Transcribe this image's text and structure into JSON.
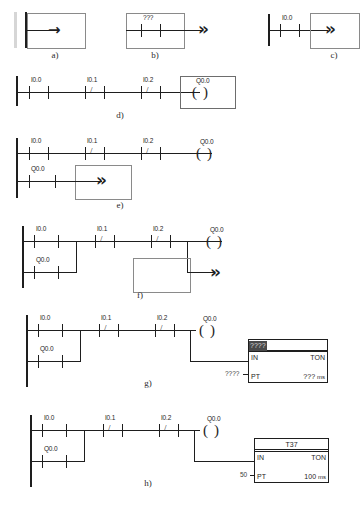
{
  "document": {
    "title": "Ladder logic editing sequence",
    "background_color": "#ffffff",
    "ink_color": "#1e1e1e"
  },
  "captions": {
    "a": "a)",
    "b": "b)",
    "c": "c)",
    "d": "d)",
    "e": "e)",
    "f": "f)",
    "g": "g)",
    "h": "h)"
  },
  "tags": {
    "unassigned": "???",
    "i00": "I0.0",
    "i01": "I0.1",
    "i02": "I0.2",
    "q00": "Q0.0",
    "nc_slash": "/"
  },
  "coil": {
    "open_paren": "(",
    "close_paren": ")",
    "label": "Q0.0"
  },
  "arrows": {
    "single": "→",
    "double": "»"
  },
  "figures": {
    "a": {
      "caption": "a)",
      "description": "empty rung with insertion arrow"
    },
    "b": {
      "caption": "b)",
      "description": "rung with unassigned contact",
      "contact_tag": "???"
    },
    "c": {
      "caption": "c)",
      "description": "rung with I0.0 contact and box",
      "contact_tag": "I0.0"
    },
    "d": {
      "caption": "d)",
      "contacts": [
        {
          "tag": "I0.0",
          "type": "NO"
        },
        {
          "tag": "I0.1",
          "type": "NC"
        },
        {
          "tag": "I0.2",
          "type": "NC"
        }
      ],
      "coil": "Q0.0"
    },
    "e": {
      "caption": "e)",
      "rung1_contacts": [
        {
          "tag": "I0.0",
          "type": "NO"
        },
        {
          "tag": "I0.1",
          "type": "NC"
        },
        {
          "tag": "I0.2",
          "type": "NC"
        }
      ],
      "rung1_coil": "Q0.0",
      "rung2_contacts": [
        {
          "tag": "Q0.0",
          "type": "NO"
        }
      ]
    },
    "f": {
      "caption": "f)",
      "rung1_contacts": [
        {
          "tag": "I0.0",
          "type": "NO"
        },
        {
          "tag": "I0.1",
          "type": "NC"
        },
        {
          "tag": "I0.2",
          "type": "NC"
        }
      ],
      "rung1_coil": "Q0.0",
      "branch_contact": {
        "tag": "Q0.0",
        "type": "NO"
      }
    },
    "g": {
      "caption": "g)",
      "rung1_contacts": [
        {
          "tag": "I0.0",
          "type": "NO"
        },
        {
          "tag": "I0.1",
          "type": "NC"
        },
        {
          "tag": "I0.2",
          "type": "NC"
        }
      ],
      "rung1_coil": "Q0.0",
      "branch_contact": {
        "tag": "Q0.0",
        "type": "NO"
      },
      "timer": {
        "name": "????",
        "name_is_placeholder": true,
        "in_label": "IN",
        "type_label": "TON",
        "pt_label": "PT",
        "pt_input": "????",
        "preset_value": "???",
        "preset_unit": "ms"
      }
    },
    "h": {
      "caption": "h)",
      "rung1_contacts": [
        {
          "tag": "I0.0",
          "type": "NO"
        },
        {
          "tag": "I0.1",
          "type": "NC"
        },
        {
          "tag": "I0.2",
          "type": "NC"
        }
      ],
      "rung1_coil": "Q0.0",
      "branch_contact": {
        "tag": "Q0.0",
        "type": "NO"
      },
      "timer": {
        "name": "T37",
        "name_is_placeholder": false,
        "in_label": "IN",
        "type_label": "TON",
        "pt_label": "PT",
        "pt_input": "50",
        "preset_value": "100",
        "preset_unit": "ms"
      }
    }
  }
}
